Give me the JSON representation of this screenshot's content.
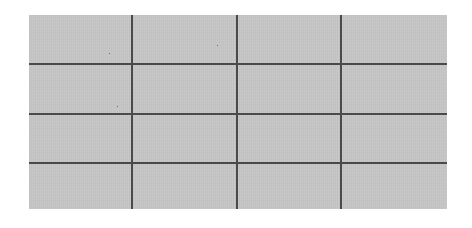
{
  "grid": {
    "rows": 4,
    "columns": 4,
    "colors": {
      "fill": "#c6c6c6",
      "line": "#4a4a4a",
      "background": "#ffffff"
    }
  }
}
